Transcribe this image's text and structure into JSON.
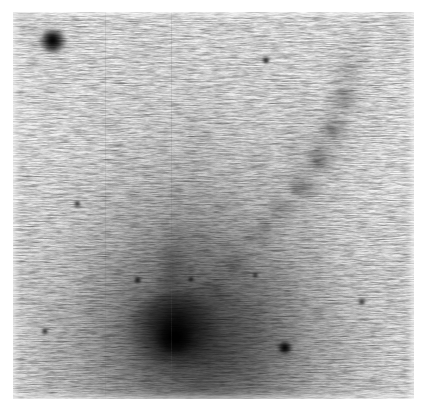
{
  "figure": {
    "kind": "astronomical-plate-image",
    "orientation": "north-up",
    "caption": "",
    "width_px": 427,
    "height_px": 417
  },
  "plate": {
    "margin_left_px": 13,
    "margin_top_px": 12,
    "exposed_width_px": 401,
    "exposed_height_px": 387,
    "paper_color": "#ffffff",
    "sky_background_color": "#ececec",
    "darkest_value_color": "#000000",
    "polarity": "inverted (sources dark on light sky)"
  },
  "objects": [
    {
      "id": "galaxy-nucleus",
      "label": "galaxy nucleus",
      "x_pct": 41,
      "y_pct": 82,
      "size_pct": 26,
      "brightness": "very bright",
      "shape": "compact elongated core"
    },
    {
      "id": "galaxy-halo",
      "label": "diffuse halo / plume",
      "x_pct": 47,
      "y_pct": 86,
      "size_pct": 58,
      "brightness": "moderate",
      "shape": "broad fan-shaped envelope"
    },
    {
      "id": "tidal-tail",
      "label": "tidal tail filament",
      "x_pct": 75,
      "y_pct": 36,
      "size_pct": 34,
      "brightness": "faint",
      "shape": "narrow curving streamer to upper right"
    },
    {
      "id": "foreground-star",
      "label": "bright foreground star",
      "x_pct": 10,
      "y_pct": 7,
      "size_pct": 6,
      "brightness": "bright",
      "shape": "stellar point source"
    },
    {
      "id": "companion-source",
      "label": "faint companion source",
      "x_pct": 68,
      "y_pct": 87,
      "size_pct": 4,
      "brightness": "faint",
      "shape": "compact point source"
    }
  ],
  "tail_segments": [
    {
      "x_pct": 50.5,
      "y_pct": 72.0,
      "w_pct": 13.0,
      "h_pct": 11.0,
      "rot": 34,
      "alpha": 0.42
    },
    {
      "x_pct": 56.0,
      "y_pct": 64.5,
      "w_pct": 12.0,
      "h_pct": 10.5,
      "rot": 34,
      "alpha": 0.46
    },
    {
      "x_pct": 61.5,
      "y_pct": 57.5,
      "w_pct": 11.5,
      "h_pct": 10.0,
      "rot": 32,
      "alpha": 0.52
    },
    {
      "x_pct": 67.0,
      "y_pct": 51.0,
      "w_pct": 11.0,
      "h_pct": 10.0,
      "rot": 30,
      "alpha": 0.58
    },
    {
      "x_pct": 72.0,
      "y_pct": 44.5,
      "w_pct": 11.0,
      "h_pct": 10.5,
      "rot": 26,
      "alpha": 0.62
    },
    {
      "x_pct": 76.5,
      "y_pct": 37.5,
      "w_pct": 11.5,
      "h_pct": 11.0,
      "rot": 20,
      "alpha": 0.62
    },
    {
      "x_pct": 80.0,
      "y_pct": 30.0,
      "w_pct": 12.0,
      "h_pct": 11.5,
      "rot": 12,
      "alpha": 0.58
    },
    {
      "x_pct": 82.5,
      "y_pct": 22.5,
      "w_pct": 12.5,
      "h_pct": 11.5,
      "rot": 4,
      "alpha": 0.5
    },
    {
      "x_pct": 84.0,
      "y_pct": 15.0,
      "w_pct": 12.0,
      "h_pct": 10.5,
      "rot": -4,
      "alpha": 0.38
    },
    {
      "x_pct": 84.5,
      "y_pct": 8.5,
      "w_pct": 10.0,
      "h_pct": 8.5,
      "rot": -8,
      "alpha": 0.24
    }
  ],
  "tail_knots": [
    {
      "x_pct": 54.5,
      "y_pct": 66.5,
      "w_pct": 4.0,
      "h_pct": 3.0,
      "alpha": 0.55
    },
    {
      "x_pct": 63.0,
      "y_pct": 55.0,
      "w_pct": 4.5,
      "h_pct": 3.2,
      "alpha": 0.6
    },
    {
      "x_pct": 70.5,
      "y_pct": 46.0,
      "w_pct": 4.5,
      "h_pct": 3.4,
      "alpha": 0.58
    },
    {
      "x_pct": 76.0,
      "y_pct": 39.0,
      "w_pct": 5.0,
      "h_pct": 3.6,
      "alpha": 0.55
    },
    {
      "x_pct": 79.5,
      "y_pct": 31.0,
      "w_pct": 4.5,
      "h_pct": 3.4,
      "alpha": 0.48
    },
    {
      "x_pct": 82.0,
      "y_pct": 21.0,
      "w_pct": 4.5,
      "h_pct": 3.2,
      "alpha": 0.4
    }
  ],
  "stars": [
    {
      "id": "star-upper-left",
      "x_pct": 9.8,
      "y_pct": 7.4,
      "w_pct": 7.2,
      "h_pct": 6.4
    },
    {
      "id": "star-lower-right",
      "x_pct": 67.8,
      "y_pct": 86.8,
      "w_pct": 4.4,
      "h_pct": 3.8
    },
    {
      "id": "star-mid-field",
      "x_pct": 31.0,
      "y_pct": 69.2,
      "w_pct": 2.2,
      "h_pct": 1.7
    },
    {
      "id": "star-upper-right",
      "x_pct": 63.0,
      "y_pct": 12.5,
      "w_pct": 2.0,
      "h_pct": 1.6
    },
    {
      "id": "star-left-field",
      "x_pct": 16.0,
      "y_pct": 49.5,
      "w_pct": 1.8,
      "h_pct": 1.4
    },
    {
      "id": "star-center-field",
      "x_pct": 44.5,
      "y_pct": 69.0,
      "w_pct": 2.0,
      "h_pct": 1.5
    },
    {
      "id": "star-right-field",
      "x_pct": 60.5,
      "y_pct": 68.0,
      "w_pct": 1.8,
      "h_pct": 1.4
    },
    {
      "id": "star-lower-left",
      "x_pct": 8.0,
      "y_pct": 82.5,
      "w_pct": 1.9,
      "h_pct": 1.5
    },
    {
      "id": "star-far-right",
      "x_pct": 87.0,
      "y_pct": 75.0,
      "w_pct": 1.8,
      "h_pct": 1.4
    }
  ],
  "seams": [
    {
      "id": "seam-left",
      "x_pct": 23.0,
      "alpha": 0.14
    },
    {
      "id": "seam-center",
      "x_pct": 39.5,
      "alpha": 0.16
    }
  ],
  "grain": {
    "type": "photographic emulsion grain",
    "character": "horizontally elongated streaks",
    "fine_opacity": 0.7,
    "coarse_opacity": 0.55,
    "streak_opacity": 0.62
  }
}
